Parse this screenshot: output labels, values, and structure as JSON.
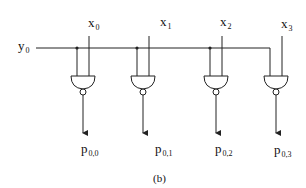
{
  "figure": {
    "caption": "(b)",
    "row_input": {
      "name": "y",
      "index": "0"
    },
    "column_inputs": [
      {
        "name": "x",
        "index": "0"
      },
      {
        "name": "x",
        "index": "1"
      },
      {
        "name": "x",
        "index": "2"
      },
      {
        "name": "x",
        "index": "3"
      }
    ],
    "outputs": [
      {
        "name": "p",
        "index": "0,0"
      },
      {
        "name": "p",
        "index": "0,1"
      },
      {
        "name": "p",
        "index": "0,2"
      },
      {
        "name": "p",
        "index": "0,3"
      }
    ],
    "gate_type": "NAND",
    "gate_count": 4,
    "colors": {
      "stroke": "#222222",
      "background": "#ffffff"
    }
  }
}
